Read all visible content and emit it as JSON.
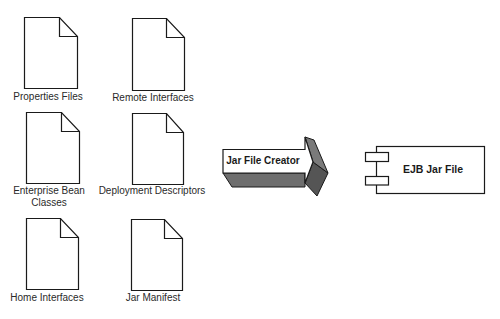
{
  "diagram": {
    "source_files": [
      {
        "id": "properties-files",
        "label": "Properties Files"
      },
      {
        "id": "remote-interfaces",
        "label": "Remote Interfaces"
      },
      {
        "id": "enterprise-bean-classes",
        "label_line1": "Enterprise Bean",
        "label_line2": "Classes"
      },
      {
        "id": "deployment-descriptors",
        "label": "Deployment Descriptors"
      },
      {
        "id": "home-interfaces",
        "label": "Home Interfaces"
      },
      {
        "id": "jar-manifest",
        "label": "Jar Manifest"
      }
    ],
    "process": {
      "label": "Jar File Creator",
      "shape": "3d-block-arrow"
    },
    "output": {
      "label": "EJB Jar File",
      "shape": "uml-component"
    },
    "colors": {
      "stroke": "#1a1a1a",
      "document_fill": "#ffffff",
      "arrow_face": "#ffffff",
      "arrow_side_dark": "#5a5a5a",
      "arrow_side_mid": "#7a7a7a",
      "background": "#ffffff"
    }
  }
}
